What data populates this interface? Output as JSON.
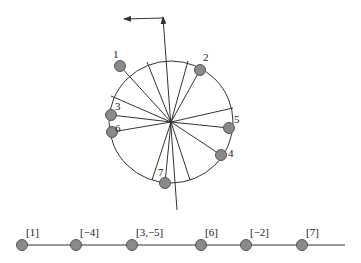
{
  "diagram": {
    "circle": {
      "cx": 171,
      "cy": 122,
      "rx": 62,
      "ry": 61
    },
    "axis": {
      "x1": 177,
      "y1": 210,
      "x2": 163,
      "y2": 17,
      "arrow_x": 124,
      "arrow_y": 19
    },
    "spokes": [
      [
        147,
        62
      ],
      [
        188,
        61
      ],
      [
        111,
        96
      ],
      [
        233,
        108
      ],
      [
        152,
        180
      ],
      [
        190,
        180
      ],
      [
        120,
        66
      ],
      [
        200,
        70
      ],
      [
        111,
        115
      ],
      [
        112,
        132
      ],
      [
        229,
        128
      ],
      [
        221,
        155
      ],
      [
        165,
        183
      ]
    ],
    "nodes": [
      {
        "id": "1",
        "label": "1",
        "x": 120,
        "y": 66,
        "lx": 113,
        "ly": 58
      },
      {
        "id": "2",
        "label": "2",
        "x": 200,
        "y": 70,
        "lx": 203,
        "ly": 61
      },
      {
        "id": "3",
        "label": "3",
        "x": 111,
        "y": 115,
        "lx": 115,
        "ly": 110
      },
      {
        "id": "6",
        "label": "6",
        "x": 112,
        "y": 132,
        "lx": 115,
        "ly": 132
      },
      {
        "id": "5",
        "label": "5",
        "x": 229,
        "y": 128,
        "lx": 234,
        "ly": 123
      },
      {
        "id": "4",
        "label": "4",
        "x": 221,
        "y": 155,
        "lx": 228,
        "ly": 157
      },
      {
        "id": "7",
        "label": "7",
        "x": 165,
        "y": 183,
        "lx": 158,
        "ly": 176
      }
    ],
    "chain": {
      "y": 245,
      "x1": 20,
      "x2": 345,
      "nodes": [
        {
          "label": "[1]",
          "x": 22
        },
        {
          "label": "[−4]",
          "x": 76
        },
        {
          "label": "[3,−5]",
          "x": 132
        },
        {
          "label": "[6]",
          "x": 201
        },
        {
          "label": "[−2]",
          "x": 246
        },
        {
          "label": "[7]",
          "x": 302
        }
      ]
    }
  }
}
